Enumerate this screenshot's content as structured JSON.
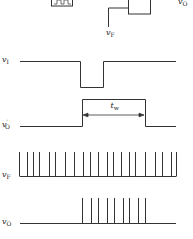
{
  "diagram": {
    "type": "timing-diagram",
    "stroke_color": "#333333",
    "top_circuit": {
      "feedback_label": "v",
      "feedback_sub": "F",
      "output_label": "v",
      "output_sub": "O"
    },
    "signals": [
      {
        "name": "vI",
        "label": "v",
        "sub": "I",
        "baseline_y": 61,
        "shape": "low-pulse",
        "pulse_start_x": 80,
        "pulse_end_x": 103,
        "pulse_level_y": 87
      },
      {
        "name": "vO'",
        "label": "v",
        "sub": "O",
        "prime": "′",
        "baseline_y": 126,
        "shape": "high-pulse",
        "pulse_start_x": 82,
        "pulse_end_x": 145,
        "pulse_level_y": 99
      },
      {
        "name": "vF",
        "label": "v",
        "sub": "F",
        "baseline_y": 176,
        "shape": "spike-train",
        "spike_top_y": 152,
        "spike_x": [
          19,
          27,
          33,
          39,
          49,
          55,
          65,
          74,
          83,
          90,
          98,
          107,
          113,
          121,
          129,
          135,
          145,
          155,
          162,
          171,
          176
        ]
      },
      {
        "name": "vO",
        "label": "v",
        "sub": "O",
        "baseline_y": 223,
        "shape": "spike-train",
        "spike_top_y": 198,
        "spike_x": [
          82,
          91,
          98,
          107,
          114,
          123,
          129,
          138,
          145
        ]
      }
    ],
    "annotation": {
      "label": "t",
      "sub": "w",
      "from_x": 83,
      "to_x": 144,
      "y": 115
    }
  }
}
